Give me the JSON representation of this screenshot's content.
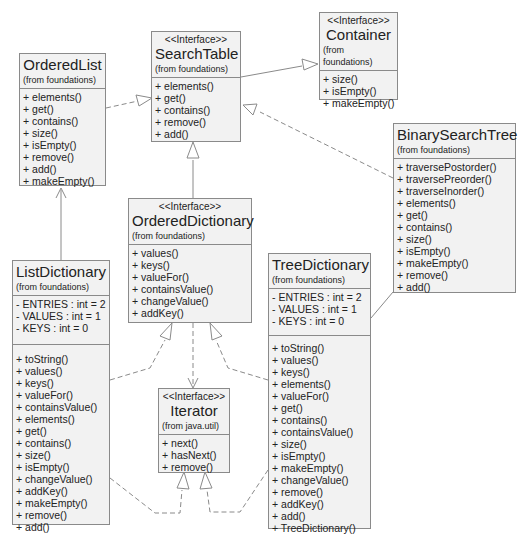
{
  "diagram": {
    "type": "UML class diagram",
    "classes": {
      "ordered_list": {
        "stereotype": null,
        "name": "OrderedList",
        "from": "(from foundations)",
        "operations": [
          "+ elements()",
          "+ get()",
          "+ contains()",
          "+ size()",
          "+ isEmpty()",
          "+ remove()",
          "+ add()",
          "+ makeEmpty()"
        ]
      },
      "search_table": {
        "stereotype": "<<Interface>>",
        "name": "SearchTable",
        "from": "(from foundations)",
        "operations": [
          "+ elements()",
          "+ get()",
          "+ contains()",
          "+ remove()",
          "+ add()"
        ]
      },
      "container": {
        "stereotype": "<<Interface>>",
        "name": "Container",
        "from": "(from foundations)",
        "operations": [
          "+ size()",
          "+ isEmpty()",
          "+ makeEmpty()"
        ]
      },
      "binary_search_tree": {
        "stereotype": null,
        "name": "BinarySearchTree",
        "from": "(from foundations)",
        "operations": [
          "+ traversePostorder()",
          "+ traversePreorder()",
          "+ traverseInorder()",
          "+ elements()",
          "+ get()",
          "+ contains()",
          "+ size()",
          "+ isEmpty()",
          "+ makeEmpty()",
          "+ remove()",
          "+ add()"
        ]
      },
      "ordered_dictionary": {
        "stereotype": "<<Interface>>",
        "name": "OrderedDictionary",
        "from": "(from foundations)",
        "operations": [
          "+ values()",
          "+ keys()",
          "+ valueFor()",
          "+ containsValue()",
          "+ changeValue()",
          "+ addKey()"
        ]
      },
      "list_dictionary": {
        "stereotype": null,
        "name": "ListDictionary",
        "from": "(from foundations)",
        "attributes": [
          "- ENTRIES : int = 2",
          "- VALUES : int = 1",
          "- KEYS : int = 0"
        ],
        "operations": [
          "+ toString()",
          "+ values()",
          "+ keys()",
          "+ valueFor()",
          "+ containsValue()",
          "+ elements()",
          "+ get()",
          "+ contains()",
          "+ size()",
          "+ isEmpty()",
          "+ changeValue()",
          "+ addKey()",
          "+ makeEmpty()",
          "+ remove()",
          "+ add()"
        ]
      },
      "iterator": {
        "stereotype": "<<Interface>>",
        "name": "Iterator",
        "from": "(from java.util)",
        "operations": [
          "+ next()",
          "+ hasNext()",
          "+ remove()"
        ]
      },
      "tree_dictionary": {
        "stereotype": null,
        "name": "TreeDictionary",
        "from": "(from foundations)",
        "attributes": [
          "- ENTRIES : int = 2",
          "- VALUES : int = 1",
          "- KEYS : int = 0"
        ],
        "operations": [
          "+ toString()",
          "+ values()",
          "+ keys()",
          "+ elements()",
          "+ valueFor()",
          "+ get()",
          "+ contains()",
          "+ containsValue()",
          "+ size()",
          "+ isEmpty()",
          "+ makeEmpty()",
          "+ changeValue()",
          "+ remove()",
          "+ addKey()",
          "+ add()",
          "+ TreeDictionary()"
        ]
      }
    },
    "relationships": [
      {
        "from": "OrderedList",
        "to": "SearchTable",
        "kind": "realization"
      },
      {
        "from": "SearchTable",
        "to": "Container",
        "kind": "generalization"
      },
      {
        "from": "BinarySearchTree",
        "to": "SearchTable",
        "kind": "realization"
      },
      {
        "from": "OrderedDictionary",
        "to": "SearchTable",
        "kind": "generalization"
      },
      {
        "from": "ListDictionary",
        "to": "OrderedList",
        "kind": "association"
      },
      {
        "from": "ListDictionary",
        "to": "OrderedDictionary",
        "kind": "realization"
      },
      {
        "from": "TreeDictionary",
        "to": "OrderedDictionary",
        "kind": "realization"
      },
      {
        "from": "TreeDictionary",
        "to": "BinarySearchTree",
        "kind": "association"
      },
      {
        "from": "OrderedDictionary",
        "to": "Iterator",
        "kind": "dependency"
      },
      {
        "from": "ListDictionary",
        "to": "Iterator",
        "kind": "realization"
      },
      {
        "from": "TreeDictionary",
        "to": "Iterator",
        "kind": "realization"
      }
    ],
    "colors": {
      "box_fill": "#f2f2f2",
      "box_border": "#8a8a8a",
      "line": "#8a8a8a"
    }
  }
}
